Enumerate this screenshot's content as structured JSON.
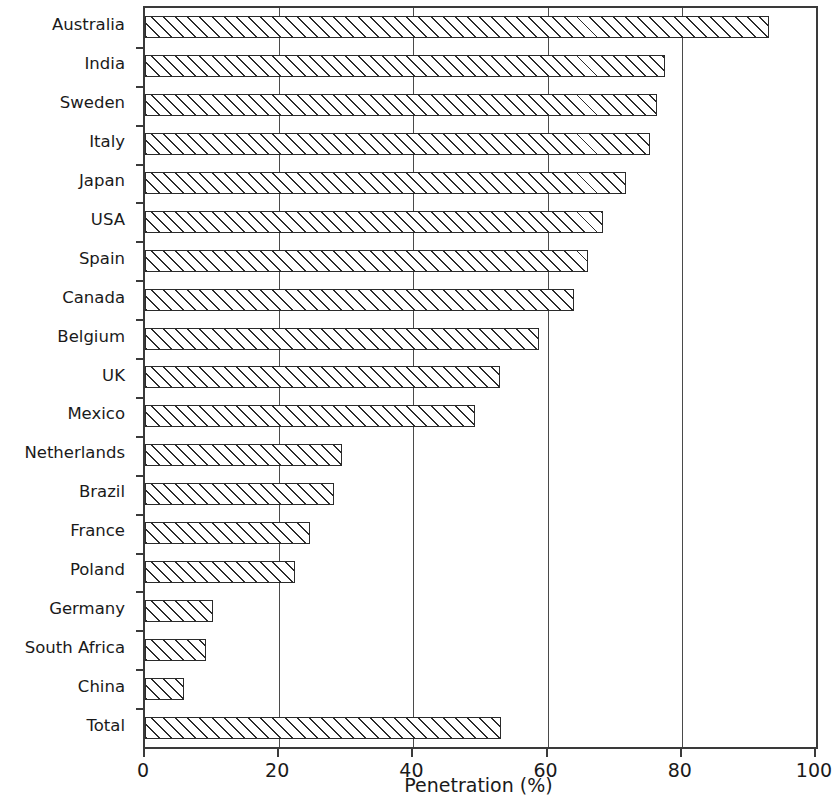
{
  "chart_data": {
    "type": "bar",
    "orientation": "horizontal",
    "title": "",
    "xlabel": "Penetration (%)",
    "ylabel": "",
    "xlim": [
      0,
      100
    ],
    "xticks": [
      0,
      20,
      40,
      60,
      80,
      100
    ],
    "xticklabels": [
      "0",
      "20",
      "40",
      "60",
      "80",
      "100"
    ],
    "grid": "vertical",
    "legend": "none",
    "bar_style": {
      "fill": "hatched-diagonal",
      "hatch": "/",
      "edge_color": "#2b2b2b",
      "face_color": "#ffffff"
    },
    "categories": [
      "Australia",
      "India",
      "Sweden",
      "Italy",
      "Japan",
      "USA",
      "Spain",
      "Canada",
      "Belgium",
      "UK",
      "Mexico",
      "Netherlands",
      "Brazil",
      "France",
      "Poland",
      "Germany",
      "South Africa",
      "China",
      "Total"
    ],
    "values": [
      93,
      77.5,
      76.3,
      75.3,
      71.7,
      68.3,
      66,
      63.9,
      58.7,
      52.9,
      49.2,
      29.4,
      28.2,
      24.6,
      22.4,
      10.1,
      9.1,
      5.8,
      53.1
    ]
  }
}
